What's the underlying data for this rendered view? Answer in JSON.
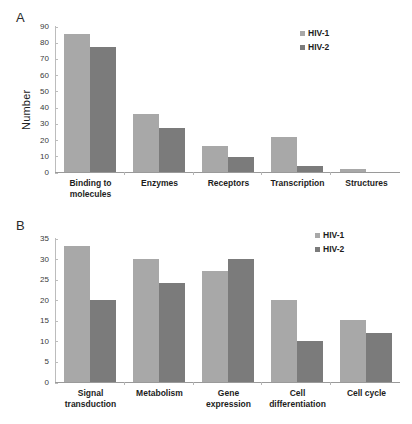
{
  "figure": {
    "panel_a_letter": "A",
    "panel_b_letter": "B"
  },
  "chart_data": [
    {
      "id": "panel-a",
      "type": "bar",
      "title": "A",
      "xlabel": "",
      "ylabel": "Number",
      "ylim": [
        0,
        90
      ],
      "yticks": [
        0,
        10,
        20,
        30,
        40,
        50,
        60,
        70,
        80,
        90
      ],
      "grid": false,
      "legend_position": "top-right",
      "categories": [
        "Binding to molecules",
        "Enzymes",
        "Receptors",
        "Transcription",
        "Structures"
      ],
      "series": [
        {
          "name": "HIV-1",
          "color": "#a8a8a8",
          "values": [
            85,
            36,
            16,
            21.5,
            2
          ]
        },
        {
          "name": "HIV-2",
          "color": "#7b7b7b",
          "values": [
            77,
            27,
            9.5,
            4,
            0
          ]
        }
      ]
    },
    {
      "id": "panel-b",
      "type": "bar",
      "title": "B",
      "xlabel": "",
      "ylabel": "Number",
      "ylim": [
        0,
        35
      ],
      "yticks": [
        0,
        5,
        10,
        15,
        20,
        25,
        30,
        35
      ],
      "grid": false,
      "legend_position": "top-right",
      "categories": [
        "Signal transduction",
        "Metabolism",
        "Gene expression",
        "Cell differentiation",
        "Cell cycle"
      ],
      "series": [
        {
          "name": "HIV-1",
          "color": "#a8a8a8",
          "values": [
            33,
            30,
            27,
            20,
            15
          ]
        },
        {
          "name": "HIV-2",
          "color": "#7b7b7b",
          "values": [
            20,
            24,
            30,
            10,
            12
          ]
        }
      ]
    }
  ]
}
